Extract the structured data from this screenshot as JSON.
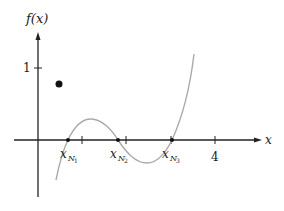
{
  "diagram": {
    "type": "function-plot",
    "axes": {
      "x_label": "x",
      "y_label": "f(x)",
      "x_ticks": [
        {
          "value": 1,
          "label": ""
        },
        {
          "value": 2,
          "label": ""
        },
        {
          "value": 3,
          "label": ""
        },
        {
          "value": 4,
          "label": "4"
        }
      ],
      "y_ticks": [
        {
          "value": 1,
          "label": "1"
        }
      ]
    },
    "roots": [
      {
        "name": "x_N1",
        "label_base": "x",
        "label_sub": "N",
        "label_subsub": "1",
        "x": 0.68
      },
      {
        "name": "x_N2",
        "label_base": "x",
        "label_sub": "N",
        "label_subsub": "2",
        "x": 1.81
      },
      {
        "name": "x_N3",
        "label_base": "x",
        "label_sub": "N",
        "label_subsub": "3",
        "x": 3.03
      }
    ],
    "point": {
      "x": 0.47,
      "y": 0.78
    },
    "curve": {
      "description": "cubic-like curve crossing x-axis at three roots",
      "color": "#aaaaaa",
      "start": {
        "x": 0.41,
        "y": -0.56
      },
      "local_max": {
        "x": 1.2,
        "y": 0.29
      },
      "local_min": {
        "x": 2.46,
        "y": -0.32
      },
      "end": {
        "x": 3.53,
        "y": 1.19
      }
    },
    "colors": {
      "axis": "#222222",
      "curve": "#aaaaaa",
      "point": "#111111"
    }
  }
}
